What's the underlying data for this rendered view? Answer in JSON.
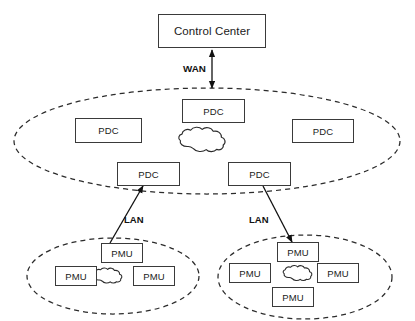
{
  "diagram": {
    "colors": {
      "box_border": "#3a3a3a",
      "ellipse_stroke": "#2b2b2b",
      "cloud_stroke": "#2b2b2b",
      "arrow_stroke": "#111111",
      "text": "#1a1a1a",
      "background": "#ffffff"
    },
    "control_center": {
      "label": "Control Center"
    },
    "links": {
      "wan": {
        "label": "WAN"
      },
      "lan_left": {
        "label": "LAN"
      },
      "lan_right": {
        "label": "LAN"
      }
    },
    "wan_region": {
      "name": "wan-ellipse",
      "nodes": [
        {
          "id": "pdc-top-center",
          "label": "PDC"
        },
        {
          "id": "pdc-left",
          "label": "PDC"
        },
        {
          "id": "pdc-right",
          "label": "PDC"
        },
        {
          "id": "pdc-bottom-left",
          "label": "PDC"
        },
        {
          "id": "pdc-bottom-right",
          "label": "PDC"
        }
      ],
      "cloud": {
        "id": "wan-cloud"
      }
    },
    "lan_left_region": {
      "name": "lan-left-ellipse",
      "nodes": [
        {
          "id": "pmu-left-top",
          "label": "PMU"
        },
        {
          "id": "pmu-left-west",
          "label": "PMU"
        },
        {
          "id": "pmu-left-east",
          "label": "PMU"
        }
      ],
      "cloud": {
        "id": "lan-left-cloud"
      }
    },
    "lan_right_region": {
      "name": "lan-right-ellipse",
      "nodes": [
        {
          "id": "pmu-right-top",
          "label": "PMU"
        },
        {
          "id": "pmu-right-west",
          "label": "PMU"
        },
        {
          "id": "pmu-right-east",
          "label": "PMU"
        },
        {
          "id": "pmu-right-bottom",
          "label": "PMU"
        }
      ],
      "cloud": {
        "id": "lan-right-cloud"
      }
    }
  }
}
